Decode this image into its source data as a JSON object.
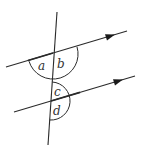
{
  "diagram": {
    "colors": {
      "line": "#2a2a2a",
      "background": "#ffffff"
    },
    "labels": {
      "a": "a",
      "b": "b",
      "c": "c",
      "d": "d"
    },
    "lines": {
      "transversal": {
        "x1": 57,
        "y1": 12,
        "x2": 48,
        "y2": 145
      },
      "upper_parallel": {
        "x1": 6,
        "y1": 67,
        "x2": 127,
        "y2": 31,
        "arrow_at": [
          110,
          36
        ]
      },
      "lower_parallel": {
        "x1": 14,
        "y1": 112,
        "x2": 135,
        "y2": 76,
        "arrow_at": [
          118,
          81
        ]
      }
    },
    "arcs": {
      "ab": {
        "center": [
          53,
          54
        ],
        "radius": 25
      },
      "cd": {
        "center": [
          51,
          101
        ],
        "radius": 19
      }
    }
  }
}
